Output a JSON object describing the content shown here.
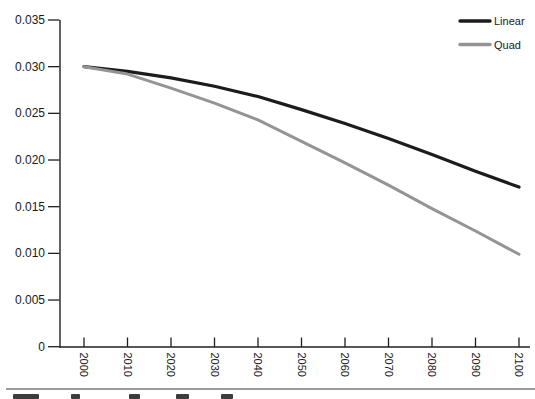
{
  "chart_data": {
    "type": "line",
    "title": "",
    "xlabel": "",
    "ylabel": "",
    "grid": false,
    "legend_position": "top-right",
    "x": [
      2000,
      2010,
      2020,
      2030,
      2040,
      2050,
      2060,
      2070,
      2080,
      2090,
      2100
    ],
    "xtick_labels": [
      "2000",
      "2010",
      "2020",
      "2030",
      "2040",
      "2050",
      "2060",
      "2070",
      "2080",
      "2090",
      "2100"
    ],
    "xtick_rotation": 90,
    "ylim": [
      0,
      0.035
    ],
    "ytick_values": [
      0.035,
      0.03,
      0.025,
      0.02,
      0.015,
      0.01,
      0.005,
      0
    ],
    "ytick_labels": [
      "0.035",
      "0.030",
      "0.025",
      "0.020",
      "0.015",
      "0.010",
      "0.005",
      "0"
    ],
    "series": [
      {
        "name": "Linear",
        "color": "#1c1c1c",
        "values": [
          0.03,
          0.0295,
          0.0288,
          0.0279,
          0.0268,
          0.0254,
          0.0239,
          0.0223,
          0.0206,
          0.0188,
          0.0171
        ]
      },
      {
        "name": "Quad",
        "color": "#949494",
        "values": [
          0.03,
          0.0292,
          0.0277,
          0.0261,
          0.0243,
          0.022,
          0.0197,
          0.0173,
          0.0148,
          0.0124,
          0.0099
        ]
      }
    ]
  },
  "style": {
    "background": "#ffffff",
    "axis_color": "#1f1f1f",
    "text_color": "#1a1a1a",
    "bottom_rule_color": "#9b9b9b",
    "caption_fragment_color": "#3c3c3c"
  }
}
